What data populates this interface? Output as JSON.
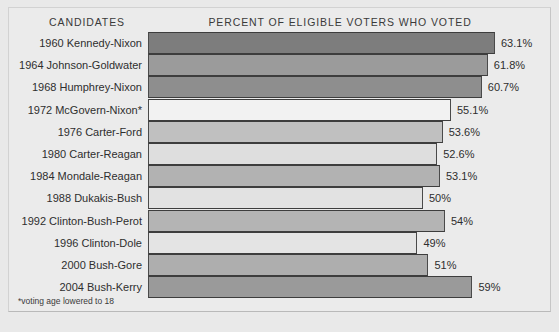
{
  "headers": {
    "candidates": "CANDIDATES",
    "values": "PERCENT OF ELIGIBLE VOTERS WHO VOTED"
  },
  "footnote": "*voting age lowered to 18",
  "colors": {
    "background": "#e9e9e9",
    "panel": "#ebebeb",
    "bar_dark": "#7d7d7d",
    "bar_mid": "#9b9b9b",
    "bar_light": "#c9c9c9",
    "bar_lightest": "#f2f2f2",
    "bar_outline": "#4a4a4a",
    "text": "#2e2e2e"
  },
  "chart_data": {
    "type": "bar",
    "orientation": "horizontal",
    "title": "PERCENT OF ELIGIBLE VOTERS WHO VOTED",
    "xlabel": "",
    "ylabel": "CANDIDATES",
    "xlim": [
      0,
      70
    ],
    "grid": false,
    "legend": "none",
    "annotations": [
      "*voting age lowered to 18"
    ],
    "categories": [
      "1960 Kennedy-Nixon",
      "1964 Johnson-Goldwater",
      "1968 Humphrey-Nixon",
      "1972 McGovern-Nixon*",
      "1976 Carter-Ford",
      "1980 Carter-Reagan",
      "1984 Mondale-Reagan",
      "1988 Dukakis-Bush",
      "1992 Clinton-Bush-Perot",
      "1996 Clinton-Dole",
      "2000 Bush-Gore",
      "2004 Bush-Kerry"
    ],
    "values": [
      63.1,
      61.8,
      60.7,
      55.1,
      53.6,
      52.6,
      53.1,
      50,
      54,
      49,
      51,
      59
    ],
    "value_labels": [
      "63.1%",
      "61.8%",
      "60.7%",
      "55.1%",
      "53.6%",
      "52.6%",
      "53.1%",
      "50%",
      "54%",
      "49%",
      "51%",
      "59%"
    ],
    "bar_colors": [
      "#7d7d7d",
      "#9b9b9b",
      "#8e8e8e",
      "#f2f2f2",
      "#c0c0c0",
      "#dedede",
      "#b2b2b2",
      "#e2e2e2",
      "#b4b4b4",
      "#e4e4e4",
      "#aeaeae",
      "#9a9a9a"
    ]
  }
}
